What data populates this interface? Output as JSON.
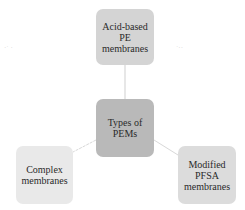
{
  "diagram": {
    "type": "hub-and-spoke",
    "center": {
      "label": "Types of\nPEMs",
      "color": "#b9b9b9"
    },
    "nodes": [
      {
        "position": "top",
        "label": "Acid-based\nPE\nmembranes",
        "color": "#d4d4d4"
      },
      {
        "position": "bottom-left",
        "label": "Complex\nmembranes",
        "color": "#e9e9e9"
      },
      {
        "position": "bottom-right",
        "label": "Modified\nPFSA\nmembranes",
        "color": "#dcdcdc"
      }
    ],
    "connector_color": "#cfcfcf"
  }
}
